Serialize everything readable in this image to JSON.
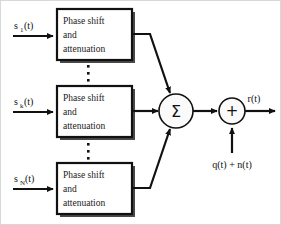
{
  "diagram": {
    "type": "block-diagram",
    "background_color": "#ffffff",
    "line_color": "#111111",
    "frame_color": "#d8d8d8"
  },
  "inputs": [
    {
      "id": "input-1",
      "base": "s",
      "subscript": "1",
      "arg": "(t)",
      "label": "s1(t)"
    },
    {
      "id": "input-k",
      "base": "s",
      "subscript": "k",
      "arg": "(t)",
      "label": "sk(t)"
    },
    {
      "id": "input-n",
      "base": "s",
      "subscript": "N",
      "arg": "(t)",
      "label": "sN(t)"
    }
  ],
  "blocks": [
    {
      "id": "block-1",
      "lines": [
        "Phase shift",
        "and",
        "attenuation"
      ]
    },
    {
      "id": "block-k",
      "lines": [
        "Phase shift",
        "and",
        "attenuation"
      ]
    },
    {
      "id": "block-n",
      "lines": [
        "Phase shift",
        "and",
        "attenuation"
      ]
    }
  ],
  "nodes": {
    "summation": {
      "id": "summation-node",
      "glyph": "Σ",
      "name": "sigma"
    },
    "adder": {
      "id": "adder-node",
      "glyph": "+",
      "name": "plus"
    }
  },
  "noise": {
    "label": "q(t) + n(t)",
    "name": "noise-input"
  },
  "output": {
    "label": "r(t)",
    "name": "output-signal"
  },
  "ellipses": {
    "upper": "⋮",
    "lower": "⋮",
    "count": 3
  }
}
